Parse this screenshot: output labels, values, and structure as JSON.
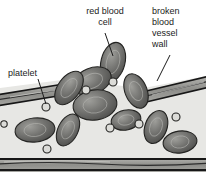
{
  "figure": {
    "background_color": "#ffffff",
    "plasma_color": "#e7e7e4",
    "wall_band_color": "#9a9a96",
    "wall_line_color": "#1f1f1f",
    "cell_fill_color": "#6e6e6b",
    "cell_edge_color": "#2a2a28",
    "cell_highlight_color": "#a9a9a5",
    "platelet_fill_color": "#dcdcd8",
    "platelet_edge_color": "#2a2a28",
    "leader_line_color": "#1b1b1b",
    "text_color": "#1b1b1b"
  },
  "labels": {
    "red_blood_cell": "red blood\ncell",
    "broken_vessel_wall": "broken\nblood\nvessel\nwall",
    "platelet": "platelet"
  },
  "diagram_data": {
    "type": "biological-illustration",
    "subject": "blood vessel wall rupture",
    "annotated_parts": [
      {
        "name": "red blood cell",
        "label": "red blood\ncell",
        "leader_from": [
          105,
          34
        ],
        "leader_to": [
          113,
          58
        ]
      },
      {
        "name": "broken blood vessel wall",
        "label": "broken\nblood\nvessel\nwall",
        "leader_from": [
          170,
          56
        ],
        "leader_to": [
          157,
          80
        ]
      },
      {
        "name": "platelet",
        "label": "platelet",
        "leader_from": [
          38,
          80
        ],
        "leader_to": [
          46,
          106
        ]
      }
    ],
    "vessel_walls": [
      {
        "name": "upper-left-wall-segment",
        "span_x": [
          0,
          62
        ],
        "span_y": [
          93,
          84
        ],
        "thickness": 11,
        "broken": true
      },
      {
        "name": "upper-right-wall-segment",
        "span_x": [
          144,
          206
        ],
        "span_y": [
          93,
          80
        ],
        "thickness": 11,
        "broken": true
      },
      {
        "name": "lower-wall-segment",
        "span_x": [
          0,
          206
        ],
        "span_y": [
          158,
          158
        ],
        "thickness": 13,
        "broken": false
      }
    ],
    "red_blood_cells": [
      {
        "cx": 113,
        "cy": 62,
        "rx": 12,
        "ry": 20,
        "rotation": 14,
        "location": "escaping-above-break"
      },
      {
        "cx": 92,
        "cy": 81,
        "rx": 20,
        "ry": 13,
        "rotation": -22,
        "location": "escaping-above-break"
      },
      {
        "cx": 69,
        "cy": 88,
        "rx": 11,
        "ry": 19,
        "rotation": 36,
        "location": "escaping-above-break"
      },
      {
        "cx": 136,
        "cy": 91,
        "rx": 11,
        "ry": 18,
        "rotation": -22,
        "location": "escaping-above-break"
      },
      {
        "cx": 95,
        "cy": 105,
        "rx": 22,
        "ry": 15,
        "rotation": -8,
        "location": "inside-vessel"
      },
      {
        "cx": 126,
        "cy": 120,
        "rx": 15,
        "ry": 10,
        "rotation": -12,
        "location": "inside-vessel"
      },
      {
        "cx": 35,
        "cy": 130,
        "rx": 20,
        "ry": 12,
        "rotation": -6,
        "location": "inside-vessel"
      },
      {
        "cx": 68,
        "cy": 130,
        "rx": 10,
        "ry": 17,
        "rotation": 26,
        "location": "inside-vessel"
      },
      {
        "cx": 156,
        "cy": 127,
        "rx": 11,
        "ry": 17,
        "rotation": 20,
        "location": "inside-vessel"
      },
      {
        "cx": 180,
        "cy": 142,
        "rx": 17,
        "ry": 11,
        "rotation": -8,
        "location": "inside-vessel"
      }
    ],
    "platelets": [
      {
        "cx": 46,
        "cy": 107,
        "r": 4,
        "label": "platelet"
      },
      {
        "cx": 86,
        "cy": 90,
        "r": 4
      },
      {
        "cx": 113,
        "cy": 82,
        "r": 4
      },
      {
        "cx": 110,
        "cy": 128,
        "r": 4
      },
      {
        "cx": 139,
        "cy": 124,
        "r": 4
      },
      {
        "cx": 176,
        "cy": 117,
        "r": 4
      },
      {
        "cx": 47,
        "cy": 149,
        "r": 4
      },
      {
        "cx": 4,
        "cy": 124,
        "r": 3
      }
    ]
  }
}
